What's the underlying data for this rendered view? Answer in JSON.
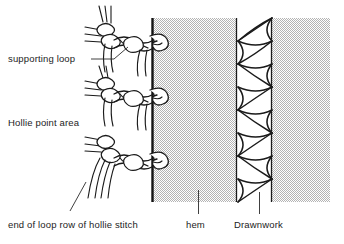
{
  "figure": {
    "background_color": "#ffffff",
    "ink_color": "#1a1a1a",
    "fabric_fill_color": "#c9c9c9",
    "labels": {
      "supporting_loop": "supporting loop",
      "hollie_point_area": "Hollie point area",
      "end_of_loop_row": "end of loop row of hollie stitch",
      "hem": "hem",
      "drawnwork": "Drawnwork"
    },
    "regions": {
      "fabric": {
        "x": 152,
        "y": 18,
        "width": 178,
        "height": 184
      },
      "hem_line_x": 152,
      "drawnwork_band": {
        "x_start": 236,
        "x_end": 272
      }
    },
    "stitch_rows": 3,
    "drawnwork_units": 8
  }
}
